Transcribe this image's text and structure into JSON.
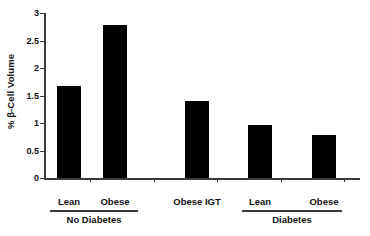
{
  "chart_data": {
    "type": "bar",
    "title": "",
    "subtitle": "",
    "xlabel": "",
    "ylabel": "% β-Cell Volume",
    "categories": [
      "Lean",
      "Obese",
      "Obese IGT",
      "Lean",
      "Obese"
    ],
    "values": [
      1.67,
      2.78,
      1.4,
      0.97,
      0.78
    ],
    "ylim": [
      0,
      3
    ],
    "yticks": [
      0,
      0.5,
      1,
      1.5,
      2,
      2.5,
      3
    ],
    "ytick_labels": [
      "0",
      "0.5",
      "1",
      "1.5",
      "2",
      "2.5",
      "3"
    ],
    "grid": false,
    "legend": "none",
    "bar_color": "#000000",
    "axis_color": "#3a3a3a",
    "background_color": "#ffffff",
    "groups": [
      {
        "label": "No Diabetes",
        "category_indices": [
          0,
          1
        ]
      },
      {
        "label": "Diabetes",
        "category_indices": [
          3,
          4
        ]
      }
    ],
    "ungrouped_categories": [
      2
    ]
  },
  "axis": {
    "y_label": "% β-Cell Volume",
    "tick_0": "0",
    "tick_1": "0.5",
    "tick_2": "1",
    "tick_3": "1.5",
    "tick_4": "2",
    "tick_5": "2.5",
    "tick_6": "3"
  },
  "categories": {
    "c0": "Lean",
    "c1": "Obese",
    "c2": "Obese IGT",
    "c3": "Lean",
    "c4": "Obese"
  },
  "groups": {
    "g0": "No Diabetes",
    "g1": "Diabetes"
  }
}
